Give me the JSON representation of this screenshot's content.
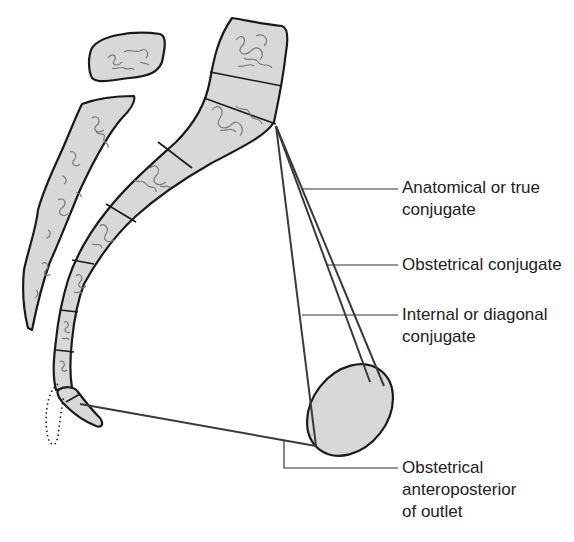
{
  "figure": {
    "type": "anatomical-diagram",
    "colors": {
      "bone_fill": "#d8d8d8",
      "outline": "#1a1a1a",
      "texture": "#7a7a7a",
      "lines": "#3a3a3a",
      "text": "#222222"
    }
  },
  "labels": {
    "anatomical_true_conjugate": {
      "line1": "Anatomical or true",
      "line2": "conjugate"
    },
    "obstetrical_conjugate": {
      "line1": "Obstetrical conjugate"
    },
    "internal_diagonal_conjugate": {
      "line1": "Internal or diagonal",
      "line2": "conjugate"
    },
    "obstetrical_ap_outlet": {
      "line1": "Obstetrical",
      "line2": "anteroposterior",
      "line3": "of outlet"
    }
  }
}
